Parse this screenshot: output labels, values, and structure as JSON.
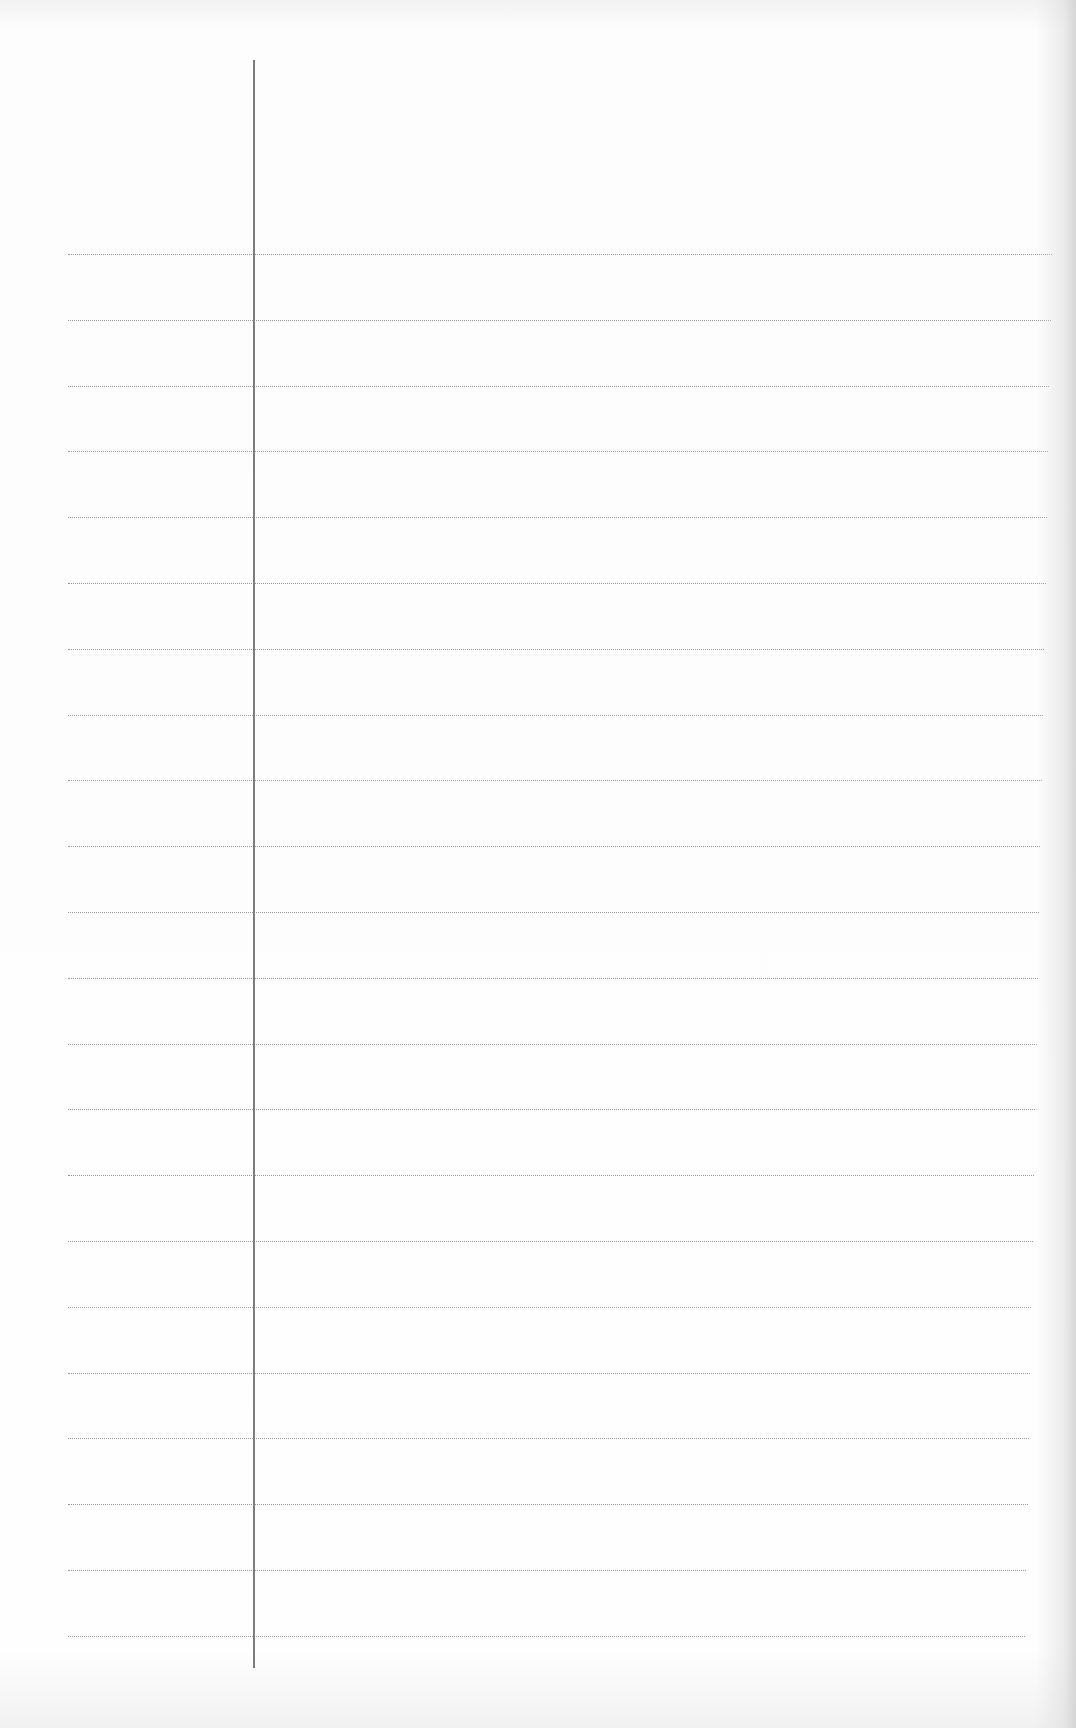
{
  "page": {
    "type": "ruled-notebook-paper",
    "background_color": "#fefefe",
    "rule_color": "#9a9a9a",
    "margin_color": "#7d7d7d",
    "margin_x": 254,
    "margin_top": 60,
    "margin_bottom": 1668,
    "rules_start_y": 254,
    "rule_spacing": 65.8,
    "rule_count": 22,
    "rule_left": 68,
    "rule_right_start": 1052,
    "rule_right_end": 1025,
    "content": ""
  }
}
